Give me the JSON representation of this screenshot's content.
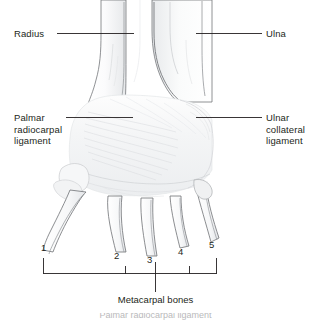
{
  "figure": {
    "background_color": "#ffffff",
    "line_color": "#231f20",
    "bone_outline_color": "#6f7175",
    "bone_fill_color": "#f4f5f6",
    "ligament_fill_color": "#f2f3f4",
    "ligament_fiber_color": "#e2e4e6"
  },
  "labels": {
    "radius": "Radius",
    "ulna": "Ulna",
    "palmar_radiocarpal_ligament": "Palmar\nradiocarpal\nligament",
    "ulnar_collateral_ligament": "Ulnar\ncollateral\nligament"
  },
  "metacarpal_numbers": [
    "1",
    "2",
    "3",
    "4",
    "5"
  ],
  "caption": "Metacarpal bones",
  "footer_note": "Palmar radiocarpal ligament"
}
